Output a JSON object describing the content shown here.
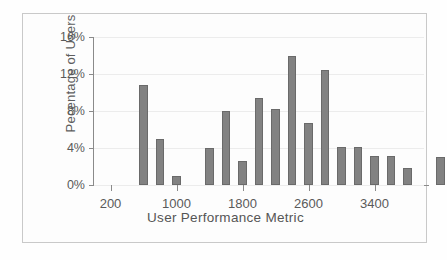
{
  "chart_data": {
    "type": "bar",
    "title": "",
    "xlabel": "User Performance Metric",
    "ylabel": "Pecentage of Users",
    "grid": true,
    "legend": null,
    "xlim": [
      0,
      4000
    ],
    "ylim": [
      0,
      16
    ],
    "bin_width": 200,
    "x_tick_values": [
      200,
      1000,
      1800,
      2600,
      3400
    ],
    "x_tick_labels": [
      "200",
      "1000",
      "1800",
      "2600",
      "3400"
    ],
    "y_tick_values": [
      0,
      4,
      8,
      12,
      16
    ],
    "y_tick_labels": [
      "0%",
      "4%",
      "8%",
      "12%",
      "16%"
    ],
    "x": [
      600,
      800,
      1000,
      1400,
      1600,
      1800,
      2000,
      2200,
      2400,
      2600,
      2800,
      3000,
      3200,
      3400,
      3600,
      4000
    ],
    "values": [
      10.8,
      5.0,
      1.0,
      4.0,
      8.0,
      2.6,
      9.4,
      8.2,
      13.9,
      6.7,
      12.4,
      4.1,
      4.1,
      3.1,
      3.1,
      1.8
    ],
    "bars": [
      {
        "x": 600,
        "value": 10.8
      },
      {
        "x": 800,
        "value": 5.0
      },
      {
        "x": 1000,
        "value": 1.0
      },
      {
        "x": 1400,
        "value": 4.0
      },
      {
        "x": 1600,
        "value": 8.0
      },
      {
        "x": 1800,
        "value": 2.6
      },
      {
        "x": 2000,
        "value": 9.4
      },
      {
        "x": 2200,
        "value": 8.2
      },
      {
        "x": 2400,
        "value": 13.9
      },
      {
        "x": 2600,
        "value": 6.7
      },
      {
        "x": 2800,
        "value": 12.4
      },
      {
        "x": 3000,
        "value": 4.1
      },
      {
        "x": 3200,
        "value": 4.1
      },
      {
        "x": 3400,
        "value": 3.1
      },
      {
        "x": 3600,
        "value": 3.1
      },
      {
        "x": 3800,
        "value": 1.8
      },
      {
        "x": 4200,
        "value": 3.0
      }
    ],
    "colors": {
      "bar_fill": "#828282",
      "bar_edge": "#6a6a6a",
      "axis": "#8a8a8a",
      "grid": "#ececec",
      "text": "#5a5a5a",
      "frame": "#c9c9c9",
      "background": "#fdfdfd"
    }
  }
}
